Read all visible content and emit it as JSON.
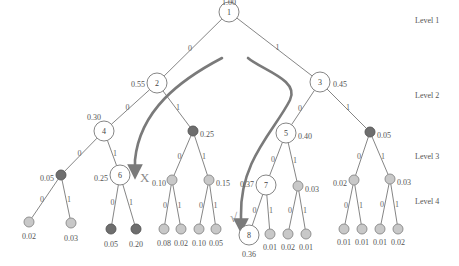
{
  "levels": [
    {
      "label": "Level 1",
      "x": 415,
      "y": 23
    },
    {
      "label": "Level 2",
      "x": 415,
      "y": 98
    },
    {
      "label": "Level 3",
      "x": 415,
      "y": 159
    },
    {
      "label": "Level 4",
      "x": 415,
      "y": 204
    }
  ],
  "colors": {
    "dark_node": "#6e6e6e",
    "light_node": "#c8c8c8",
    "big_node": "#ffffff",
    "arrow": "#7a7a7a"
  },
  "nodes": [
    {
      "id": "n1",
      "kind": "big",
      "label": "1",
      "x": 229,
      "y": 12,
      "prob": "1.00",
      "px": 229,
      "py": 2,
      "anchor": "middle"
    },
    {
      "id": "n2",
      "kind": "big",
      "label": "2",
      "x": 157,
      "y": 83,
      "prob": "0.55",
      "px": 145,
      "py": 84,
      "anchor": "end"
    },
    {
      "id": "n3",
      "kind": "big",
      "label": "3",
      "x": 320,
      "y": 82,
      "prob": "0.45",
      "px": 333,
      "py": 84,
      "anchor": "start"
    },
    {
      "id": "n4",
      "kind": "big",
      "label": "4",
      "x": 104,
      "y": 131,
      "prob": "0.30",
      "px": 101,
      "py": 117,
      "anchor": "end"
    },
    {
      "id": "n2r",
      "kind": "dark",
      "label": "",
      "x": 193,
      "y": 131,
      "prob": "0.25",
      "px": 200,
      "py": 134,
      "anchor": "start"
    },
    {
      "id": "n5",
      "kind": "big",
      "label": "5",
      "x": 286,
      "y": 133,
      "prob": "0.40",
      "px": 298,
      "py": 136,
      "anchor": "start"
    },
    {
      "id": "n3r",
      "kind": "dark",
      "label": "",
      "x": 370,
      "y": 132,
      "prob": "0.05",
      "px": 377,
      "py": 135,
      "anchor": "start"
    },
    {
      "id": "n4l",
      "kind": "dark",
      "label": "",
      "x": 61,
      "y": 175,
      "prob": "0.05",
      "px": 54,
      "py": 178,
      "anchor": "end"
    },
    {
      "id": "n6",
      "kind": "big",
      "label": "6",
      "x": 120,
      "y": 175,
      "prob": "0.25",
      "px": 108,
      "py": 178,
      "anchor": "end"
    },
    {
      "id": "n2rl",
      "kind": "light",
      "label": "",
      "x": 172,
      "y": 180,
      "prob": "0.10",
      "px": 166,
      "py": 183,
      "anchor": "end"
    },
    {
      "id": "n2rr",
      "kind": "light",
      "label": "",
      "x": 209,
      "y": 180,
      "prob": "0.15",
      "px": 216,
      "py": 183,
      "anchor": "start"
    },
    {
      "id": "n7",
      "kind": "big",
      "label": "7",
      "x": 266,
      "y": 185,
      "prob": "0.37",
      "px": 254,
      "py": 184,
      "anchor": "end"
    },
    {
      "id": "n5r",
      "kind": "light",
      "label": "",
      "x": 298,
      "y": 186,
      "prob": "0.03",
      "px": 305,
      "py": 189,
      "anchor": "start"
    },
    {
      "id": "n3rl",
      "kind": "light",
      "label": "",
      "x": 354,
      "y": 180,
      "prob": "0.02",
      "px": 347,
      "py": 183,
      "anchor": "end"
    },
    {
      "id": "n3rr",
      "kind": "light",
      "label": "",
      "x": 390,
      "y": 179,
      "prob": "0.03",
      "px": 397,
      "py": 182,
      "anchor": "start"
    },
    {
      "id": "l1",
      "kind": "light",
      "label": "",
      "x": 29,
      "y": 222,
      "prob": "0.02",
      "px": 29,
      "py": 236,
      "anchor": "middle"
    },
    {
      "id": "l2",
      "kind": "light",
      "label": "",
      "x": 71,
      "y": 223,
      "prob": "0.03",
      "px": 71,
      "py": 238,
      "anchor": "middle"
    },
    {
      "id": "l3",
      "kind": "dark",
      "label": "",
      "x": 111,
      "y": 229,
      "prob": "0.05",
      "px": 111,
      "py": 244,
      "anchor": "middle"
    },
    {
      "id": "l4",
      "kind": "dark",
      "label": "",
      "x": 136,
      "y": 229,
      "prob": "0.20",
      "px": 136,
      "py": 244,
      "anchor": "middle"
    },
    {
      "id": "l5",
      "kind": "light",
      "label": "",
      "x": 164,
      "y": 229,
      "prob": "0.08",
      "px": 164,
      "py": 243,
      "anchor": "middle"
    },
    {
      "id": "l6",
      "kind": "light",
      "label": "",
      "x": 181,
      "y": 229,
      "prob": "0.02",
      "px": 181,
      "py": 243,
      "anchor": "middle"
    },
    {
      "id": "l7",
      "kind": "light",
      "label": "",
      "x": 199,
      "y": 229,
      "prob": "0.10",
      "px": 199,
      "py": 243,
      "anchor": "middle"
    },
    {
      "id": "l8",
      "kind": "light",
      "label": "",
      "x": 216,
      "y": 229,
      "prob": "0.05",
      "px": 216,
      "py": 243,
      "anchor": "middle"
    },
    {
      "id": "n8",
      "kind": "big",
      "label": "8",
      "x": 249,
      "y": 235,
      "prob": "0.36",
      "px": 249,
      "py": 254,
      "anchor": "middle"
    },
    {
      "id": "l9",
      "kind": "light",
      "label": "",
      "x": 270,
      "y": 234,
      "prob": "0.01",
      "px": 270,
      "py": 247,
      "anchor": "middle"
    },
    {
      "id": "l10",
      "kind": "light",
      "label": "",
      "x": 288,
      "y": 234,
      "prob": "0.02",
      "px": 288,
      "py": 247,
      "anchor": "middle"
    },
    {
      "id": "l11",
      "kind": "light",
      "label": "",
      "x": 306,
      "y": 234,
      "prob": "0.01",
      "px": 306,
      "py": 247,
      "anchor": "middle"
    },
    {
      "id": "l12",
      "kind": "light",
      "label": "",
      "x": 344,
      "y": 229,
      "prob": "0.01",
      "px": 344,
      "py": 242,
      "anchor": "middle"
    },
    {
      "id": "l13",
      "kind": "light",
      "label": "",
      "x": 362,
      "y": 229,
      "prob": "0.01",
      "px": 362,
      "py": 242,
      "anchor": "middle"
    },
    {
      "id": "l14",
      "kind": "light",
      "label": "",
      "x": 380,
      "y": 229,
      "prob": "0.01",
      "px": 380,
      "py": 242,
      "anchor": "middle"
    },
    {
      "id": "l15",
      "kind": "light",
      "label": "",
      "x": 398,
      "y": 229,
      "prob": "0.02",
      "px": 398,
      "py": 242,
      "anchor": "middle"
    }
  ],
  "edges": [
    {
      "from": "n1",
      "to": "n2",
      "label": "0"
    },
    {
      "from": "n1",
      "to": "n3",
      "label": "1"
    },
    {
      "from": "n2",
      "to": "n4",
      "label": "0"
    },
    {
      "from": "n2",
      "to": "n2r",
      "label": "1"
    },
    {
      "from": "n3",
      "to": "n5",
      "label": "0"
    },
    {
      "from": "n3",
      "to": "n3r",
      "label": "1"
    },
    {
      "from": "n4",
      "to": "n4l",
      "label": "0"
    },
    {
      "from": "n4",
      "to": "n6",
      "label": "1"
    },
    {
      "from": "n2r",
      "to": "n2rl",
      "label": "0"
    },
    {
      "from": "n2r",
      "to": "n2rr",
      "label": "1"
    },
    {
      "from": "n5",
      "to": "n7",
      "label": "0"
    },
    {
      "from": "n5",
      "to": "n5r",
      "label": "1"
    },
    {
      "from": "n3r",
      "to": "n3rl",
      "label": "0"
    },
    {
      "from": "n3r",
      "to": "n3rr",
      "label": "1"
    },
    {
      "from": "n4l",
      "to": "l1",
      "label": "0"
    },
    {
      "from": "n4l",
      "to": "l2",
      "label": "1"
    },
    {
      "from": "n6",
      "to": "l3",
      "label": "0"
    },
    {
      "from": "n6",
      "to": "l4",
      "label": "1"
    },
    {
      "from": "n2rl",
      "to": "l5",
      "label": "0"
    },
    {
      "from": "n2rl",
      "to": "l6",
      "label": "1"
    },
    {
      "from": "n2rr",
      "to": "l7",
      "label": "0"
    },
    {
      "from": "n2rr",
      "to": "l8",
      "label": "1"
    },
    {
      "from": "n7",
      "to": "n8",
      "label": "0"
    },
    {
      "from": "n7",
      "to": "l9",
      "label": "1"
    },
    {
      "from": "n5r",
      "to": "l10",
      "label": "0"
    },
    {
      "from": "n5r",
      "to": "l11",
      "label": "1"
    },
    {
      "from": "n3rl",
      "to": "l12",
      "label": "0"
    },
    {
      "from": "n3rl",
      "to": "l13",
      "label": "1"
    },
    {
      "from": "n3rr",
      "to": "l14",
      "label": "0"
    },
    {
      "from": "n3rr",
      "to": "l15",
      "label": "1"
    }
  ],
  "arrows": [
    {
      "name": "greedy-path-arrow",
      "d": "M 222 58 C 180 80, 140 110, 135 160",
      "head": [
        135,
        172
      ]
    },
    {
      "name": "optimal-path-arrow",
      "d": "M 248 58 C 262 70, 300 80, 290 100 C 275 130, 240 160, 241 215",
      "head": [
        241,
        226
      ]
    }
  ],
  "marks": [
    {
      "name": "cross-mark",
      "glyph": "X",
      "x": 140,
      "y": 182
    },
    {
      "name": "check-mark",
      "glyph": "√",
      "x": 230,
      "y": 222
    }
  ]
}
